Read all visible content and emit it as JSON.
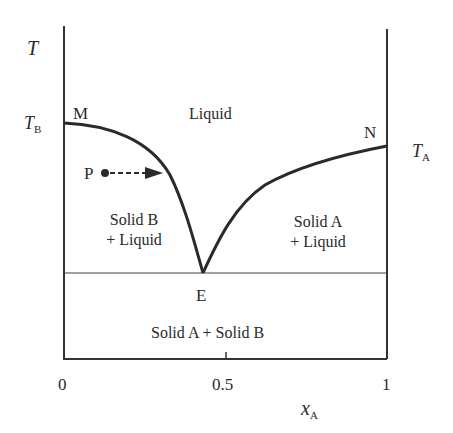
{
  "diagram": {
    "type": "eutectic phase diagram",
    "axes": {
      "y_label": "T",
      "x_label": "x",
      "x_label_sub": "A",
      "x_ticks": [
        "0",
        "0.5",
        "1"
      ]
    },
    "temperatures": {
      "left": {
        "main": "T",
        "sub": "B"
      },
      "right": {
        "main": "T",
        "sub": "A"
      }
    },
    "points": {
      "M": "M",
      "N": "N",
      "E": "E",
      "P": "P"
    },
    "regions": {
      "liquid": "Liquid",
      "solid_b_liquid_line1": "Solid B",
      "solid_b_liquid_line2": "+ Liquid",
      "solid_a_liquid_line1": "Solid A",
      "solid_a_liquid_line2": "+ Liquid",
      "solid_solid": "Solid A + Solid B"
    },
    "colors": {
      "line": "#2a2a2a",
      "background": "#ffffff"
    }
  }
}
